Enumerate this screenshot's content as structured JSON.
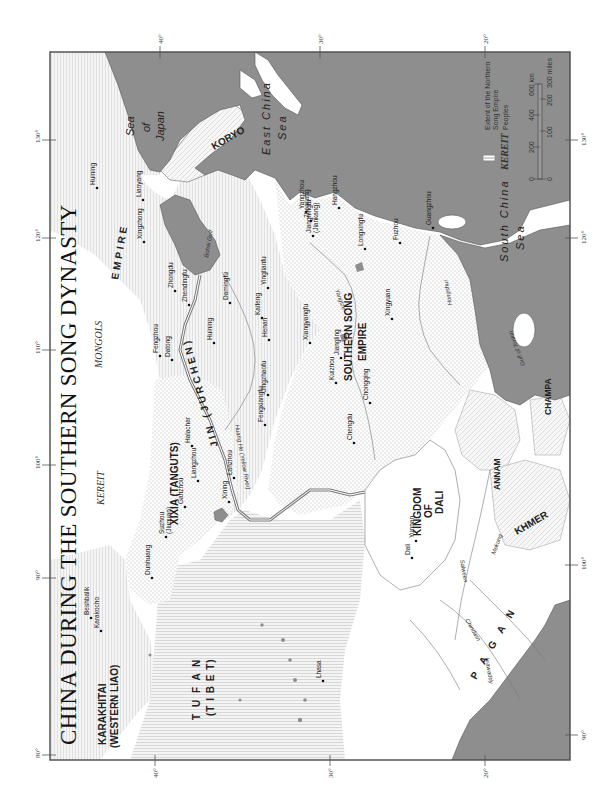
{
  "title": "CHINA DURING THE SOUTHERN SONG DYNASTY",
  "colors": {
    "sea": "#8e8e8e",
    "land_unclaimed": "#ffffff",
    "northern_song_line": "#7a7a7a",
    "song_dots": "#bdbdbd",
    "hatch": "#c8c8c8",
    "frame": "#555555"
  },
  "graticule": {
    "longitudes_top": [
      "130°",
      "120°",
      "110°",
      "100°",
      "90°",
      "80°"
    ],
    "longitudes_bottom": [
      "130°",
      "120°",
      "110°",
      "100°",
      "90°"
    ],
    "latitudes_left": [
      "40°",
      "30°",
      "20°"
    ],
    "latitudes_right": [
      "40°",
      "30°",
      "20°"
    ]
  },
  "states": {
    "southern_song": [
      "SOUTHERN SONG",
      "EMPIRE"
    ],
    "jin": "JIN (JURCHEN)",
    "jin_empire": "EMPIRE",
    "xixia": "XIXIA (TANGUTS)",
    "karakhitai": [
      "KARAKHITAI",
      "(WESTERN LIAO)"
    ],
    "tufan": [
      "T U F A N",
      "(T I B E T)"
    ],
    "dali": [
      "KINGDOM",
      "OF",
      "DALI"
    ],
    "pagan": "P A G A N",
    "koryo": "KORYO",
    "annam": "ANNAM",
    "champa": "CHAMPA",
    "khmer": "KHMER"
  },
  "peoples": {
    "mongols": "MONGOLS",
    "kereit": "KEREIT"
  },
  "seas": {
    "sea_of_japan": [
      "Sea",
      "of",
      "Japan"
    ],
    "east_china_sea": [
      "East China",
      "Sea"
    ],
    "south_china_sea": [
      "South China",
      "Sea"
    ],
    "bohai_gulf": "Bohai Gulf",
    "gulf_of_tonkin": "Gulf of Tonkin"
  },
  "rivers": {
    "huang_he": "Huang He (Yellow River)",
    "yangtze": "Yangtze",
    "hongshui": "Hongshui",
    "mekong": "Mekong",
    "salween": "Salween",
    "irrawaddy": "Irrawaddy",
    "chindwin": "Chindwin"
  },
  "cities": [
    {
      "name": "Huining",
      "x": 97,
      "y": 188
    },
    {
      "name": "Liaoyang",
      "x": 143,
      "y": 200
    },
    {
      "name": "Xingzhong",
      "x": 144,
      "y": 242
    },
    {
      "name": "Zhongdu",
      "x": 175,
      "y": 291
    },
    {
      "name": "Zhendingfu",
      "x": 189,
      "y": 305
    },
    {
      "name": "Damingfu",
      "x": 230,
      "y": 303
    },
    {
      "name": "Yingtianfu",
      "x": 268,
      "y": 288
    },
    {
      "name": "Kaifeng",
      "x": 262,
      "y": 318
    },
    {
      "name": "Henan",
      "x": 269,
      "y": 340
    },
    {
      "name": "Huining",
      "x": 214,
      "y": 343
    },
    {
      "name": "Fengzhou",
      "x": 160,
      "y": 356
    },
    {
      "name": "Datong",
      "x": 172,
      "y": 360
    },
    {
      "name": "Jingzhaofu",
      "x": 268,
      "y": 395
    },
    {
      "name": "Fengxiangfu",
      "x": 265,
      "y": 425
    },
    {
      "name": "Halachar",
      "x": 192,
      "y": 446
    },
    {
      "name": "Liangzhou",
      "x": 198,
      "y": 481
    },
    {
      "name": "Lanzhou",
      "x": 234,
      "y": 478
    },
    {
      "name": "Xining",
      "x": 229,
      "y": 502
    },
    {
      "name": "Ganzhou",
      "x": 185,
      "y": 507
    },
    {
      "name": "Suzhou",
      "sub": "(Jiuquan)",
      "x": 166,
      "y": 537
    },
    {
      "name": "Dunhuang",
      "x": 152,
      "y": 578
    },
    {
      "name": "Beshbalik",
      "x": 91,
      "y": 618
    },
    {
      "name": "Karakocho",
      "x": 101,
      "y": 631
    },
    {
      "name": "Lhasa",
      "x": 323,
      "y": 681
    },
    {
      "name": "Yangzhou",
      "x": 306,
      "y": 212
    },
    {
      "name": "Zhenjiang",
      "x": 311,
      "y": 221
    },
    {
      "name": "Hangzhou",
      "x": 339,
      "y": 208
    },
    {
      "name": "Jiangningfu",
      "sub": "(Jiankang)",
      "x": 313,
      "y": 236
    },
    {
      "name": "Longxingfu",
      "x": 365,
      "y": 249
    },
    {
      "name": "Fuzhou",
      "x": 400,
      "y": 243
    },
    {
      "name": "Xiangyangfu",
      "x": 310,
      "y": 343
    },
    {
      "name": "Jiangling",
      "x": 341,
      "y": 358
    },
    {
      "name": "Kuizhou",
      "x": 336,
      "y": 383
    },
    {
      "name": "Chongqing",
      "x": 370,
      "y": 403
    },
    {
      "name": "Chengdu",
      "x": 354,
      "y": 443
    },
    {
      "name": "Xingyuan",
      "x": 392,
      "y": 319
    },
    {
      "name": "Guangzhou",
      "x": 433,
      "y": 228
    },
    {
      "name": "Dali",
      "x": 412,
      "y": 558
    },
    {
      "name": "Yunnan",
      "x": 416,
      "y": 541
    }
  ],
  "legend": {
    "northern_song": [
      "Extent of the Northern",
      "Song Empire"
    ],
    "peoples_sample": "KEREIT",
    "peoples_label": "Peoples",
    "scale_km": [
      "0",
      "200",
      "400",
      "600 km"
    ],
    "scale_miles": [
      "0",
      "100",
      "200",
      "300 miles"
    ]
  }
}
